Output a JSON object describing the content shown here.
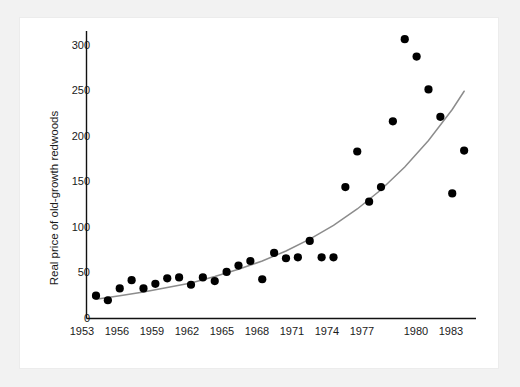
{
  "figure": {
    "background_color": "#f2f2f2",
    "panel_color": "#ffffff",
    "point_color": "#000000",
    "curve_color": "#8c8c8c",
    "axis_color": "#111111"
  },
  "chart_data": {
    "type": "scatter",
    "title": "",
    "subtitle": "",
    "xlabel": "",
    "ylabel": "Real price of old-growth redwoods",
    "xlim": [
      1952.2,
      1985.0
    ],
    "ylim": [
      0,
      315
    ],
    "grid": false,
    "legend": null,
    "x_ticks": [
      1953,
      1956,
      1959,
      1962,
      1965,
      1968,
      1971,
      1974,
      1977,
      1980,
      1983
    ],
    "x_tick_labels": [
      "1953",
      "1956",
      "1959",
      "1962",
      "1965",
      "1968",
      "1971",
      "1974",
      "1977",
      "1980",
      "1983"
    ],
    "y_ticks": [
      0,
      50,
      100,
      150,
      200,
      250,
      300
    ],
    "y_tick_labels": [
      "0",
      "50",
      "100",
      "150",
      "200",
      "250",
      "300"
    ],
    "series": [
      {
        "name": "Real price of old-growth redwoods",
        "marker": "filled-circle",
        "x": [
          1953,
          1954,
          1955,
          1956,
          1957,
          1958,
          1959,
          1960,
          1961,
          1962,
          1963,
          1964,
          1965,
          1966,
          1967,
          1968,
          1969,
          1970,
          1971,
          1972,
          1973,
          1974,
          1975,
          1976,
          1977,
          1978,
          1979,
          1980,
          1981,
          1982,
          1983,
          1984
        ],
        "y": [
          25,
          20,
          33,
          42,
          33,
          38,
          44,
          45,
          37,
          45,
          41,
          51,
          58,
          63,
          43,
          72,
          66,
          67,
          85,
          67,
          67,
          144,
          183,
          128,
          144,
          216,
          306,
          287,
          251,
          221,
          137,
          184
        ]
      }
    ],
    "fit_curve": {
      "name": "exponential trend",
      "style": "solid",
      "color": "#8c8c8c",
      "x": [
        1953,
        1955,
        1957,
        1959,
        1961,
        1963,
        1965,
        1967,
        1969,
        1971,
        1973,
        1975,
        1977,
        1979,
        1981,
        1983,
        1984
      ],
      "y": [
        21,
        25,
        29,
        34,
        39,
        46,
        54,
        63,
        74,
        87,
        102,
        120,
        141,
        166,
        195,
        229,
        249
      ]
    }
  }
}
